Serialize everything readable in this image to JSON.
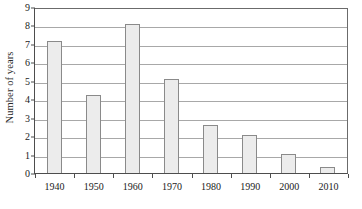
{
  "chart_data": {
    "type": "bar",
    "title": "",
    "xlabel": "",
    "ylabel": "Number of years",
    "categories": [
      "1940",
      "1950",
      "1960",
      "1970",
      "1980",
      "1990",
      "2000",
      "2010"
    ],
    "values": [
      7.15,
      4.25,
      8.1,
      5.1,
      2.6,
      2.05,
      1.05,
      0.3
    ],
    "ylim": [
      0,
      9
    ],
    "ytick_labels": [
      "0",
      "1",
      "2",
      "3",
      "4",
      "5",
      "6",
      "7",
      "8",
      "9"
    ],
    "ytick_values": [
      0,
      1,
      2,
      3,
      4,
      5,
      6,
      7,
      8,
      9
    ],
    "grid": true,
    "legend": "none",
    "bar_fill_color": "#ececec",
    "bar_border_color": "#8a8a8a",
    "gridline_color": "#a8a8a8",
    "axis_color": "#4d4d4d",
    "background_color": "#ffffff"
  }
}
